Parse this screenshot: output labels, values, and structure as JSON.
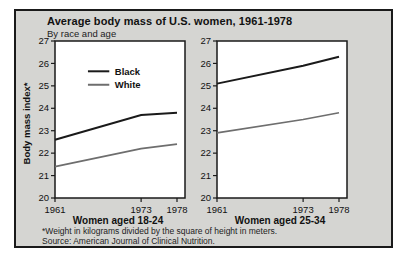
{
  "figure": {
    "title": "Average body mass of U.S. women, 1961-1978",
    "subtitle": "By race and age",
    "y_axis_label": "Body mass index*",
    "footnote": "*Weight in kilograms divided by the square of height in meters.",
    "source": "Source: American Journal of Clinical Nutrition.",
    "colors": {
      "background": "#d5d5d2",
      "border": "#1a1a1a",
      "plot_background": "#ffffff",
      "black_series": "#1a1a1a",
      "white_series": "#6e6e6e"
    }
  },
  "legend": {
    "position": "upper-left-of-first-chart",
    "items": [
      {
        "label": "Black",
        "color": "#1a1a1a"
      },
      {
        "label": "White",
        "color": "#6e6e6e"
      }
    ]
  },
  "chart_data": [
    {
      "type": "line",
      "title": "Women aged 18-24",
      "x": [
        1961,
        1973,
        1978
      ],
      "x_tick_labels": [
        "1961",
        "1973",
        "1978"
      ],
      "ylim": [
        20,
        27
      ],
      "y_ticks": [
        20,
        21,
        22,
        23,
        24,
        25,
        26,
        27
      ],
      "grid": false,
      "show_legend": true,
      "series": [
        {
          "name": "Black",
          "values": [
            22.6,
            23.7,
            23.8
          ]
        },
        {
          "name": "White",
          "values": [
            21.4,
            22.2,
            22.4
          ]
        }
      ]
    },
    {
      "type": "line",
      "title": "Women aged 25-34",
      "x": [
        1961,
        1973,
        1978
      ],
      "x_tick_labels": [
        "1961",
        "1973",
        "1978"
      ],
      "ylim": [
        20,
        27
      ],
      "y_ticks": [
        20,
        21,
        22,
        23,
        24,
        25,
        26,
        27
      ],
      "grid": false,
      "show_legend": false,
      "series": [
        {
          "name": "Black",
          "values": [
            25.1,
            25.9,
            26.3
          ]
        },
        {
          "name": "White",
          "values": [
            22.9,
            23.5,
            23.8
          ]
        }
      ]
    }
  ]
}
